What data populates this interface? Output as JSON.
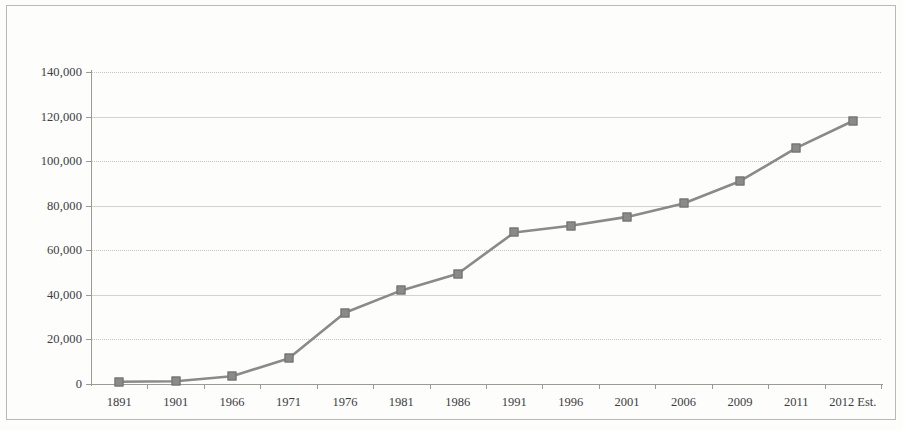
{
  "chart_data": {
    "type": "line",
    "title": "",
    "subtitle": "",
    "xlabel": "",
    "ylabel": "",
    "categories": [
      "1891",
      "1901",
      "1966",
      "1971",
      "1976",
      "1981",
      "1986",
      "1991",
      "1996",
      "2001",
      "2006",
      "2009",
      "2011",
      "2012 Est."
    ],
    "values": [
      1000,
      1200,
      3500,
      11500,
      32000,
      42000,
      49500,
      68000,
      71000,
      75000,
      81000,
      91000,
      106000,
      118000
    ],
    "series": [
      {
        "name": "Population",
        "values": [
          1000,
          1200,
          3500,
          11500,
          32000,
          42000,
          49500,
          68000,
          71000,
          75000,
          81000,
          91000,
          106000,
          118000
        ]
      }
    ],
    "ylim": [
      0,
      140000
    ],
    "y_ticks": [
      0,
      20000,
      40000,
      60000,
      80000,
      100000,
      120000,
      140000
    ],
    "y_tick_labels": [
      "0",
      "20,000",
      "40,000",
      "60,000",
      "80,000",
      "100,000",
      "120,000",
      "140,000"
    ],
    "grid": true,
    "legend": false,
    "legend_position": "none",
    "marker": "square",
    "line_color": "#8a8a8a",
    "marker_color": "#8a8a8a",
    "grid_color": "#c5c5c2",
    "axis_color": "#9a9a97",
    "text_color": "#3c3c3c"
  }
}
